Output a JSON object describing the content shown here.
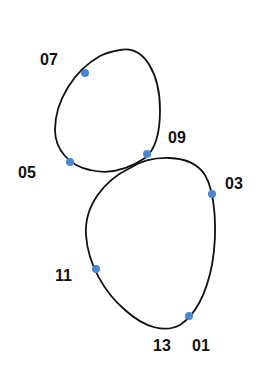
{
  "diagram": {
    "type": "figure-eight trajectory",
    "line_color": "#111111",
    "point_color": "#4a86d4",
    "points": [
      {
        "label": "07",
        "x": 85,
        "y": 73,
        "lx": 40,
        "ly": 52
      },
      {
        "label": "09",
        "x": 147,
        "y": 154,
        "lx": 168,
        "ly": 130
      },
      {
        "label": "05",
        "x": 70,
        "y": 162,
        "lx": 18,
        "ly": 165
      },
      {
        "label": "03",
        "x": 212,
        "y": 194,
        "lx": 225,
        "ly": 176
      },
      {
        "label": "11",
        "x": 96,
        "y": 269,
        "lx": 55,
        "ly": 268
      },
      {
        "label": "01",
        "x": 189,
        "y": 316,
        "lx": 192,
        "ly": 338
      },
      {
        "label": "13",
        "x": 189,
        "y": 316,
        "lx": 153,
        "ly": 338
      }
    ]
  }
}
